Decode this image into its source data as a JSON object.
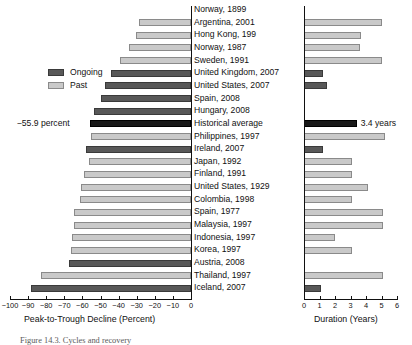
{
  "figure": {
    "caption": "Figure 14.3.  Cycles and recovery"
  },
  "legend": {
    "position": "left-upper",
    "entries": [
      {
        "label": "Ongoing",
        "color": "#585858"
      },
      {
        "label": "Past",
        "color": "#c9c9c9"
      }
    ]
  },
  "annotations": [
    {
      "text": "−55.9 percent",
      "panel": "left",
      "row": "Historical average"
    },
    {
      "text": "3.4 years",
      "panel": "right",
      "row": "Historical average"
    }
  ],
  "colors": {
    "ongoing": "#585858",
    "past": "#c9c9c9",
    "average": "#181818",
    "axis": "#111111"
  },
  "chart_data": [
    {
      "type": "bar",
      "id": "decline-panel",
      "title": "",
      "xlabel": "Peak-to-Trough Decline (Percent)",
      "ylabel": "",
      "orientation": "horizontal",
      "xlim": [
        -100,
        0
      ],
      "xticks": [
        -100,
        -90,
        -80,
        -70,
        -60,
        -50,
        -40,
        -30,
        -20,
        -10,
        0
      ],
      "xticklabels": [
        "−100",
        "−90",
        "−80",
        "−70",
        "−60",
        "−50",
        "−40",
        "−30",
        "−20",
        "−10",
        "0"
      ],
      "grid": false,
      "legend": [
        "Ongoing",
        "Past"
      ],
      "categories": [
        "Norway, 1899",
        "Argentina, 2001",
        "Hong Kong, 199",
        "Norway, 1987",
        "Sweden, 1991",
        "United Kingdom, 2007",
        "United States, 2007",
        "Spain, 2008",
        "Hungary, 2008",
        "Historical average",
        "Philippines, 1997",
        "Ireland, 2007",
        "Japan, 1992",
        "Finland, 1991",
        "United States, 1929",
        "Colombia, 1998",
        "Spain, 1977",
        "Malaysia, 1997",
        "Indonesia, 1997",
        "Korea, 1997",
        "Austria, 2008",
        "Thailand, 1997",
        "Iceland, 2007"
      ],
      "values": [
        null,
        -29.0,
        -30.5,
        -34.5,
        -39.0,
        -44.0,
        -47.5,
        -50.0,
        -53.5,
        -55.9,
        -55.0,
        -58.0,
        -56.5,
        -59.0,
        -60.5,
        -61.5,
        -64.5,
        -64.5,
        -66.0,
        -66.5,
        -67.5,
        -83.0,
        -88.5
      ],
      "series_kind": [
        "past",
        "past",
        "past",
        "past",
        "past",
        "ongoing",
        "ongoing",
        "ongoing",
        "ongoing",
        "average",
        "past",
        "ongoing",
        "past",
        "past",
        "past",
        "past",
        "past",
        "past",
        "past",
        "past",
        "ongoing",
        "past",
        "ongoing"
      ]
    },
    {
      "type": "bar",
      "id": "duration-panel",
      "title": "",
      "xlabel": "Duration (Years)",
      "ylabel": "",
      "orientation": "horizontal",
      "xlim": [
        0,
        6
      ],
      "xticks": [
        0,
        1,
        2,
        3,
        4,
        5,
        6
      ],
      "xticklabels": [
        "0",
        "1",
        "2",
        "3",
        "4",
        "5",
        "6"
      ],
      "grid": false,
      "categories": [
        "Norway, 1899",
        "Argentina, 2001",
        "Hong Kong, 199",
        "Norway, 1987",
        "Sweden, 1991",
        "United Kingdom, 2007",
        "United States, 2007",
        "Spain, 2008",
        "Hungary, 2008",
        "Historical average",
        "Philippines, 1997",
        "Ireland, 2007",
        "Japan, 1992",
        "Finland, 1991",
        "United States, 1929",
        "Colombia, 1998",
        "Spain, 1977",
        "Malaysia, 1997",
        "Indonesia, 1997",
        "Korea, 1997",
        "Austria, 2008",
        "Thailand, 1997",
        "Iceland, 2007"
      ],
      "values": [
        null,
        5.0,
        3.7,
        3.6,
        5.0,
        1.2,
        1.5,
        null,
        0.0,
        3.4,
        5.2,
        1.2,
        3.1,
        3.1,
        4.1,
        3.1,
        5.1,
        5.1,
        2.0,
        3.1,
        null,
        5.1,
        1.1
      ],
      "series_kind": [
        "past",
        "past",
        "past",
        "past",
        "past",
        "ongoing",
        "ongoing",
        "ongoing",
        "ongoing",
        "average",
        "past",
        "ongoing",
        "past",
        "past",
        "past",
        "past",
        "past",
        "past",
        "past",
        "past",
        "ongoing",
        "past",
        "ongoing"
      ]
    }
  ]
}
